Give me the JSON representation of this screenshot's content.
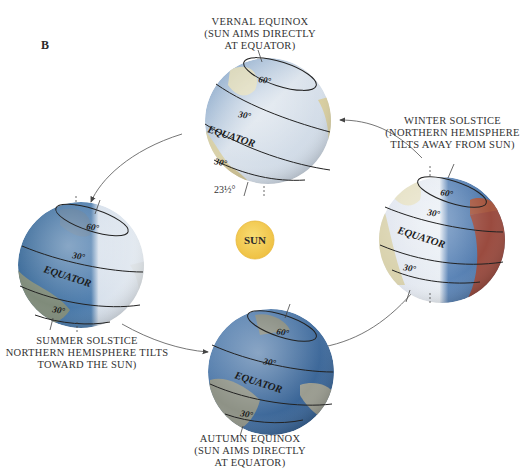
{
  "figure": {
    "panel_label": "B",
    "sun_label": "SUN",
    "colors": {
      "sun_fill": "#f4cf55",
      "sun_edge": "#e8b93a",
      "ocean_light": "#dfe6ef",
      "ocean_dark": "#3f6d9c",
      "land": "#d8cfa4",
      "land_dark": "#8a8f7a",
      "land_red": "#9c4a40",
      "arrow": "#555555"
    },
    "orbit_direction": "counter-clockwise: winter -> vernal -> summer -> autumn -> winter"
  },
  "positions": {
    "vernal": {
      "caption_lines": [
        "VERNAL EQUINOX",
        "(SUN AIMS DIRECTLY",
        "AT EQUATOR)"
      ],
      "latitudes": {
        "north_high": "60°",
        "north_mid": "30°",
        "equator": "EQUATOR",
        "south_mid": "30°"
      },
      "tilt_label": "23½°"
    },
    "winter": {
      "caption_lines": [
        "WINTER SOLSTICE",
        "(NORTHERN HEMISPHERE",
        "TILTS AWAY FROM SUN)"
      ],
      "latitudes": {
        "north_high": "60°",
        "north_mid": "30°",
        "equator": "EQUATOR",
        "south_mid": "30°"
      }
    },
    "summer": {
      "caption_lines": [
        "SUMMER SOLSTICE",
        "NORTHERN HEMISPHERE TILTS",
        "TOWARD THE SUN)"
      ],
      "latitudes": {
        "north_high": "60°",
        "north_mid": "30°",
        "equator": "EQUATOR",
        "south_mid": "30°"
      }
    },
    "autumn": {
      "caption_lines": [
        "AUTUMN EQUINOX",
        "(SUN AIMS DIRECTLY",
        "AT EQUATOR)"
      ],
      "latitudes": {
        "north_high": "60°",
        "north_mid": "30°",
        "equator": "EQUATOR",
        "south_mid": "30°"
      }
    }
  }
}
